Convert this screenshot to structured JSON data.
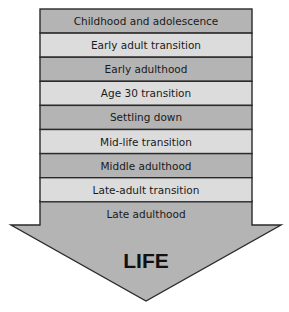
{
  "diagram": {
    "stages": [
      {
        "label": "Childhood and adolescence",
        "shade": "dark"
      },
      {
        "label": "Early adult transition",
        "shade": "light"
      },
      {
        "label": "Early adulthood",
        "shade": "dark"
      },
      {
        "label": "Age 30 transition",
        "shade": "light"
      },
      {
        "label": "Settling down",
        "shade": "dark"
      },
      {
        "label": "Mid-life transition",
        "shade": "light"
      },
      {
        "label": "Middle adulthood",
        "shade": "dark"
      },
      {
        "label": "Late-adult transition",
        "shade": "light"
      },
      {
        "label": "Late adulthood",
        "shade": "dark"
      }
    ],
    "arrow_label": "LIFE",
    "colors": {
      "dark": "#b4b4b4",
      "light": "#dcdcdc",
      "border": "#2a2a2a",
      "text": "#1a1a1a"
    }
  }
}
